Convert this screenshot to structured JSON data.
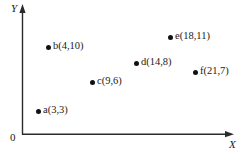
{
  "figure": {
    "background_color": "#ffffff",
    "ink_color": "#111111",
    "origin_label": "0",
    "x_axis_label": "X",
    "y_axis_label": "Y"
  },
  "chart_data": {
    "type": "scatter",
    "title": "",
    "subtitle": "",
    "xlabel": "X",
    "ylabel": "Y",
    "origin_label": "0",
    "grid": false,
    "legend": "none",
    "axis_arrows": true,
    "xlim": [
      0,
      24
    ],
    "ylim": [
      0,
      13
    ],
    "xticks": [],
    "yticks": [],
    "point_marker": "filled-circle",
    "points": [
      {
        "name": "a",
        "label": "a(3,3)",
        "x": 3,
        "y": 3,
        "px": 38,
        "py": 111
      },
      {
        "name": "b",
        "label": "b(4,10)",
        "x": 4,
        "y": 10,
        "px": 48,
        "py": 47
      },
      {
        "name": "c",
        "label": "c(9,6)",
        "x": 9,
        "y": 6,
        "px": 92,
        "py": 82
      },
      {
        "name": "d",
        "label": "d(14,8)",
        "x": 14,
        "y": 8,
        "px": 136,
        "py": 63
      },
      {
        "name": "e",
        "label": "e(18,11)",
        "x": 18,
        "y": 11,
        "px": 170,
        "py": 37
      },
      {
        "name": "f",
        "label": "f(21,7)",
        "x": 21,
        "y": 7,
        "px": 195,
        "py": 72
      }
    ],
    "series": [
      {
        "name": "points",
        "x": [
          3,
          4,
          9,
          14,
          18,
          21
        ],
        "values": [
          3,
          10,
          6,
          8,
          11,
          7
        ]
      }
    ]
  }
}
